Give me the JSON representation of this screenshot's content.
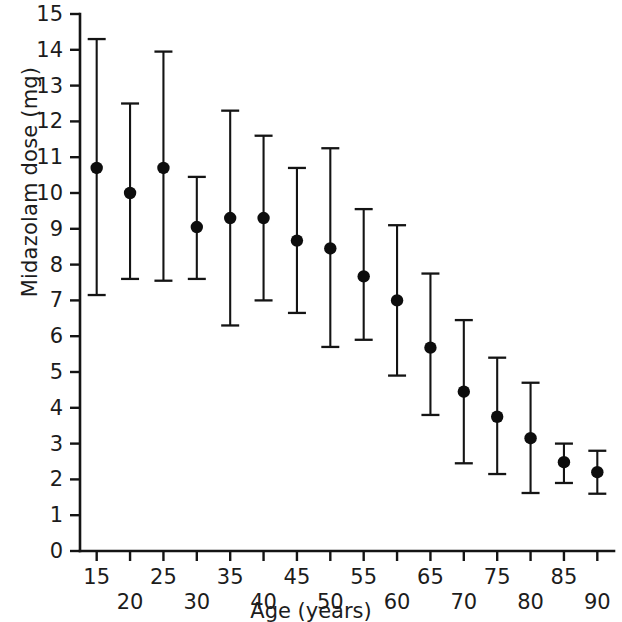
{
  "chart_data": {
    "type": "scatter",
    "title": "",
    "xlabel": "Age (years)",
    "ylabel": "Midazolam dose (mg)",
    "xlim": [
      12.5,
      92.5
    ],
    "ylim": [
      0,
      15
    ],
    "grid": false,
    "legend": null,
    "error_bars": "vertical",
    "x": [
      15,
      20,
      25,
      30,
      35,
      40,
      45,
      50,
      55,
      60,
      65,
      70,
      75,
      80,
      85,
      90
    ],
    "values": [
      10.7,
      10.0,
      10.7,
      9.05,
      9.3,
      9.3,
      8.67,
      8.45,
      7.67,
      7.0,
      5.68,
      4.45,
      3.75,
      3.15,
      2.48,
      2.2
    ],
    "error_low": [
      7.15,
      7.6,
      7.55,
      7.6,
      6.3,
      7.0,
      6.65,
      5.7,
      5.9,
      4.9,
      3.8,
      2.45,
      2.15,
      1.62,
      1.9,
      1.6
    ],
    "error_high": [
      14.3,
      12.5,
      13.95,
      10.45,
      12.3,
      11.6,
      10.7,
      11.25,
      9.55,
      9.1,
      7.75,
      6.45,
      5.4,
      4.7,
      3.0,
      2.8
    ],
    "xticks": [
      15,
      20,
      25,
      30,
      35,
      40,
      45,
      50,
      55,
      60,
      65,
      70,
      75,
      80,
      85,
      90
    ],
    "xtick_labels_upper": [
      "15",
      "",
      "25",
      "",
      "35",
      "",
      "45",
      "",
      "55",
      "",
      "65",
      "",
      "75",
      "",
      "85",
      ""
    ],
    "xtick_labels_lower": [
      "",
      "20",
      "",
      "30",
      "",
      "40",
      "",
      "50",
      "",
      "60",
      "",
      "70",
      "",
      "80",
      "",
      "90"
    ],
    "yticks": [
      0,
      1,
      2,
      3,
      4,
      5,
      6,
      7,
      8,
      9,
      10,
      11,
      12,
      13,
      14,
      15
    ],
    "ytick_labels": [
      "0",
      "1",
      "2",
      "3",
      "4",
      "5",
      "6",
      "7",
      "8",
      "9",
      "10",
      "11",
      "12",
      "13",
      "14",
      "15"
    ],
    "marker_color": "#0d0d0d",
    "axis_color": "#141414",
    "background_color": "#ffffff"
  }
}
